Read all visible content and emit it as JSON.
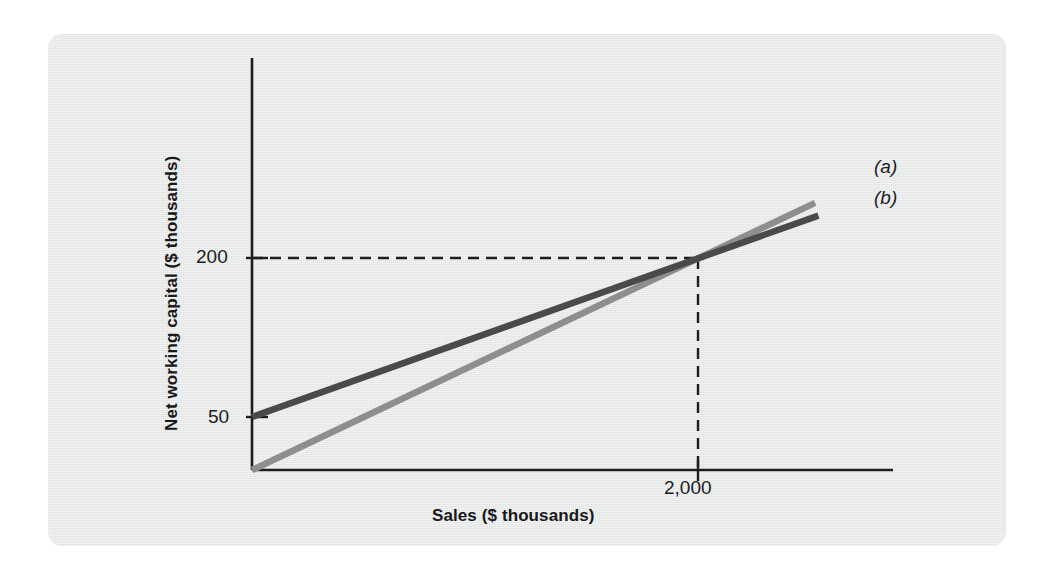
{
  "figure": {
    "panel_background": "#e8e9e9",
    "page_background": "#ffffff"
  },
  "chart_data": {
    "type": "line",
    "title": "",
    "subtitle": "",
    "xlabel": "Sales ($ thousands)",
    "ylabel": "Net working capital ($ thousands)",
    "xlim": [
      0,
      2600
    ],
    "ylim": [
      0,
      260
    ],
    "grid": false,
    "legend_position": "right-of-line-ends",
    "x_ticks": [
      {
        "value": 2000,
        "label": "2,000"
      }
    ],
    "y_ticks": [
      {
        "value": 200,
        "label": "200"
      },
      {
        "value": 50,
        "label": "50"
      }
    ],
    "series": [
      {
        "name": "(a)",
        "label": "(a)",
        "color": "#8e8e8e",
        "style": "solid",
        "intercept": 0,
        "x": [
          0,
          2000,
          2525
        ],
        "values": [
          0,
          200,
          252
        ]
      },
      {
        "name": "(b)",
        "label": "(b)",
        "color": "#4a4a4a",
        "style": "solid",
        "intercept": 50,
        "x": [
          0,
          2000,
          2540
        ],
        "values": [
          50,
          200,
          240
        ]
      }
    ],
    "annotations": [
      {
        "name": "crossover-guides",
        "kind": "dashed-crosshair",
        "x": 2000,
        "y": 200,
        "x_label": "2,000",
        "y_label": "200",
        "color": "#1d1d1f"
      }
    ],
    "axis_color": "#1d1d1f"
  }
}
